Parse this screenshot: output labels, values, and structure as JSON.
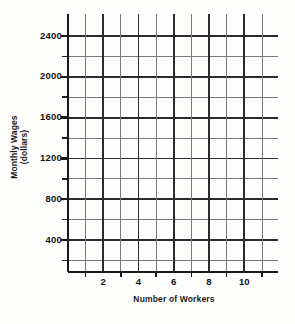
{
  "chart_data": {
    "type": "line",
    "title": "",
    "xlabel": "Number of Workers",
    "ylabel": "Monthly Wages (dollars)",
    "ylabel_line1": "Monthly Wages",
    "ylabel_line2": "(dollars)",
    "series": [],
    "data_points": [],
    "grid": true,
    "legend": "none",
    "note": "Empty graph paper / blank coordinate grid with no plotted data",
    "xlim": [
      0,
      11
    ],
    "ylim": [
      0,
      2600
    ],
    "x_major_step": 2,
    "x_minor_step": 1,
    "y_major_step": 400,
    "y_minor_step": 200,
    "x_tick_labels": [
      "2",
      "4",
      "6",
      "8",
      "10"
    ],
    "x_tick_values": [
      2,
      4,
      6,
      8,
      10
    ],
    "x_minor_values": [
      1,
      3,
      5,
      7,
      9,
      11
    ],
    "y_tick_labels": [
      "2400",
      "2000",
      "1600",
      "1200",
      "800",
      "400"
    ],
    "y_tick_values": [
      2400,
      2000,
      1600,
      1200,
      800,
      400
    ],
    "y_minor_values": [
      200,
      600,
      1000,
      1400,
      1800,
      2200
    ],
    "colors": {
      "background": "#fdfdfb",
      "major_line": "#2b2b2b",
      "minor_line": "#7a7a7a",
      "axis": "#1a1a1a",
      "text": "#141414"
    }
  }
}
